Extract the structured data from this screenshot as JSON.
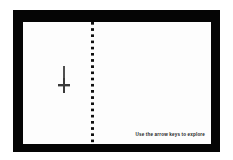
{
  "scene": {
    "title": "Book Spread Explorer",
    "frame_color": "#050505",
    "page_color": "#fdfdfd",
    "canvas_color": "#ffffff"
  },
  "spine": {
    "style": "dotted",
    "orientation": "vertical",
    "dot_color": "#101010"
  },
  "left_page": {
    "cursor_icon": "dagger-down-arrow-icon",
    "cursor_color": "#3a3a3a"
  },
  "right_page": {
    "hint_text": "Use the arrow keys to explore",
    "hint_color": "#1c1c1c"
  }
}
